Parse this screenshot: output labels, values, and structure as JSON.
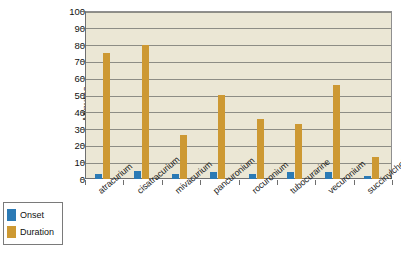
{
  "chart_data": {
    "type": "bar",
    "title": "",
    "xlabel": "",
    "ylabel": "Minutes",
    "ylim": [
      0,
      100
    ],
    "yticks": [
      0,
      10,
      20,
      30,
      40,
      50,
      60,
      70,
      80,
      90,
      100
    ],
    "grid": true,
    "legend_position": "bottom-left",
    "categories": [
      "atracurium",
      "cisatracurium",
      "mivacurium",
      "pancuronium",
      "rocuronium",
      "tubocurarine",
      "vecuronium",
      "succinylcholine"
    ],
    "series": [
      {
        "name": "Onset",
        "color": "#2b7ab5",
        "values": [
          3,
          5,
          3,
          4,
          3,
          4,
          4,
          2
        ]
      },
      {
        "name": "Duration",
        "color": "#cd9933",
        "values": [
          75,
          80,
          26,
          50,
          36,
          33,
          56,
          13
        ]
      }
    ]
  },
  "legend": {
    "items": [
      {
        "label": "Onset",
        "color": "#2b7ab5"
      },
      {
        "label": "Duration",
        "color": "#cd9933"
      }
    ]
  },
  "colors": {
    "plot_background": "#ebe7d5",
    "gridline": "#8d8d85",
    "axis": "#6f6f6f",
    "page_background": "#ffffff",
    "onset": "#2b7ab5",
    "duration": "#cd9933"
  }
}
